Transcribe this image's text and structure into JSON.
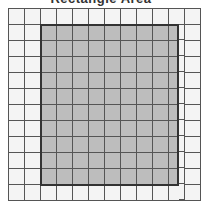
{
  "title": "Rectangle Area",
  "grid": {
    "columns": 12,
    "rows": 12,
    "cell_size_px": 16,
    "line_color": "#555555",
    "cell_color": "#f4f4f4"
  },
  "shaded_rectangle": {
    "col_start": 2,
    "col_end": 10,
    "row_start": 1,
    "row_end": 11,
    "width_units": 8.6,
    "height_units": 10,
    "fill_color": "#bdbdbd",
    "border_color": "#333333"
  }
}
